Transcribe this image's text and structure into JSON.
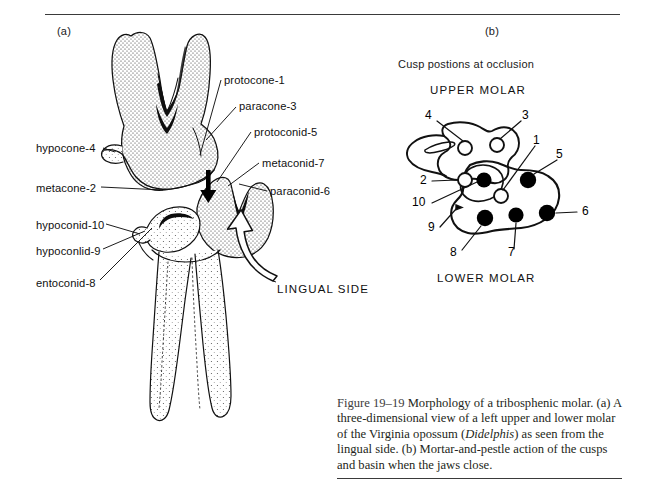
{
  "figure": {
    "panel_a_letter": "(a)",
    "panel_b_letter": "(b)"
  },
  "panel_a": {
    "labels_left": [
      {
        "text": "hypocone-4",
        "x": 36,
        "y": 142
      },
      {
        "text": "metacone-2",
        "x": 36,
        "y": 182
      },
      {
        "text": "hypoconid-10",
        "x": 36,
        "y": 219
      },
      {
        "text": "hypoconlid-9",
        "x": 36,
        "y": 245
      },
      {
        "text": "entoconid-8",
        "x": 36,
        "y": 277
      }
    ],
    "labels_right": [
      {
        "text": "protocone-1",
        "x": 224,
        "y": 80
      },
      {
        "text": "paracone-3",
        "x": 239,
        "y": 105
      },
      {
        "text": "protoconid-5",
        "x": 254,
        "y": 130
      },
      {
        "text": "metaconid-7",
        "x": 262,
        "y": 160
      },
      {
        "text": "paracone",
        "x": 270,
        "y": 189
      }
    ],
    "labels_right_full": [
      "protocone-1",
      "paracone-3",
      "protoconid-5",
      "metaconid-7",
      "paraconid-6"
    ],
    "lingual_side": "LINGUAL SIDE"
  },
  "panel_b": {
    "heading": "Cusp postions at occlusion",
    "upper_molar": "UPPER MOLAR",
    "lower_molar": "LOWER MOLAR",
    "callouts": [
      {
        "id": "4",
        "x": 425,
        "y": 116
      },
      {
        "id": "3",
        "x": 522,
        "y": 113
      },
      {
        "id": "1",
        "x": 533,
        "y": 138
      },
      {
        "id": "5",
        "x": 558,
        "y": 152
      },
      {
        "id": "2",
        "x": 419,
        "y": 177
      },
      {
        "id": "10",
        "x": 414,
        "y": 200
      },
      {
        "id": "6",
        "x": 580,
        "y": 210
      },
      {
        "id": "9",
        "x": 427,
        "y": 228
      },
      {
        "id": "8",
        "x": 451,
        "y": 251
      },
      {
        "id": "7",
        "x": 511,
        "y": 253
      }
    ],
    "cusps_upper_open": [
      {
        "id": "4",
        "cx": 465,
        "cy": 148,
        "r": 7
      },
      {
        "id": "3",
        "cx": 497,
        "cy": 145,
        "r": 7
      },
      {
        "id": "2",
        "cx": 465,
        "cy": 180,
        "r": 7
      },
      {
        "id": "1",
        "cx": 501,
        "cy": 196,
        "r": 7
      }
    ],
    "cusps_lower_filled": [
      {
        "id": "10",
        "cx": 483,
        "cy": 180,
        "r": 7.5
      },
      {
        "id": "5",
        "cx": 527,
        "cy": 180,
        "r": 8
      },
      {
        "id": "6",
        "cx": 546,
        "cy": 213,
        "r": 8
      },
      {
        "id": "7",
        "cx": 515,
        "cy": 215,
        "r": 7.5
      },
      {
        "id": "8",
        "cx": 484,
        "cy": 218,
        "r": 8
      },
      {
        "id": "9",
        "cx": 460,
        "cy": 208,
        "r": 2.6
      }
    ]
  },
  "caption": {
    "figure_number": "Figure 19–19",
    "text_before_italic": "Morphology of a tribosphenic molar. (a) A three-dimensional view of a left upper and lower molar of the Virginia opossum (",
    "italic_term": "Didelphis",
    "text_after_italic": ") as seen from the lingual side. (b) Mortar-and-pestle action of the cusps and basin when the jaws close."
  },
  "colors": {
    "ink": "#111111",
    "rule": "#3a3a3a",
    "caption_text": "#231f20",
    "background": "#ffffff"
  }
}
